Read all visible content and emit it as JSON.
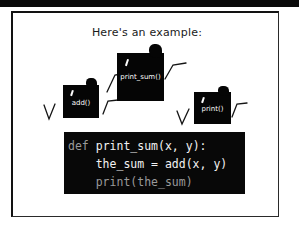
{
  "panel": {
    "title": "Here's an example:",
    "background_color": "#ffffff",
    "ink_color": "#0a0a0a"
  },
  "blobs": [
    {
      "id": "add",
      "label": "add()"
    },
    {
      "id": "print_sum",
      "label": "print_sum()"
    },
    {
      "id": "print",
      "label": "print()"
    }
  ],
  "code": {
    "language": "python",
    "background_color": "#080808",
    "text_color": "#f2f2f2",
    "lines": [
      {
        "prefix": "def ",
        "body": "print_sum(x, y):"
      },
      {
        "prefix": "",
        "body": "    the_sum = add(x, y)"
      },
      {
        "prefix": "",
        "body": "    print(the_sum)"
      }
    ],
    "line1_prefix": "def ",
    "line1_body": "print_sum(x, y):",
    "line2": "    the_sum = add(x, y)",
    "line3": "    print(the_sum)"
  }
}
